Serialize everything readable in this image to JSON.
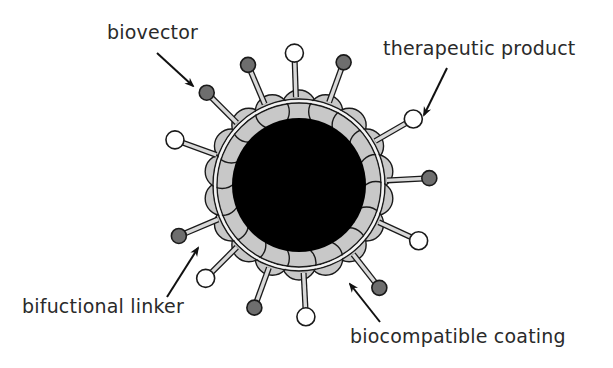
{
  "diagram": {
    "labels": {
      "biovector": "biovector",
      "therapeutic_product": "therapeutic product",
      "bifunctional_linker": "bifuctional linker",
      "biocompatible_coating": "biocompatible coating"
    },
    "colors": {
      "core": "#000000",
      "coating": "#c8c8c8",
      "biovector_ball": "#6e6e6e",
      "therapeutic_ball": "#ffffff",
      "linker_stick": "#d9d9d9",
      "outline": "#1a1a1a"
    },
    "core": {
      "cx": 299,
      "cy": 185,
      "r": 67
    },
    "ring": {
      "r_inner": 82,
      "r_outer": 86
    },
    "ligands": [
      {
        "type": "biovector",
        "angle": -135
      },
      {
        "type": "biovector",
        "angle": -113
      },
      {
        "type": "therapeutic",
        "angle": -92
      },
      {
        "type": "biovector",
        "angle": -70
      },
      {
        "type": "therapeutic",
        "angle": -30
      },
      {
        "type": "biovector",
        "angle": -3
      },
      {
        "type": "therapeutic",
        "angle": 25
      },
      {
        "type": "biovector",
        "angle": 52
      },
      {
        "type": "therapeutic",
        "angle": 87
      },
      {
        "type": "biovector",
        "angle": 110
      },
      {
        "type": "therapeutic",
        "angle": 135
      },
      {
        "type": "biovector",
        "angle": 157
      },
      {
        "type": "therapeutic",
        "angle": -160
      }
    ]
  }
}
